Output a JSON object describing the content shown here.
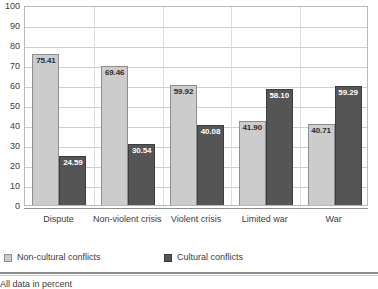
{
  "chart_data": {
    "type": "bar",
    "title": "",
    "subtitle": "",
    "xlabel": "",
    "ylabel": "",
    "ylim": [
      0,
      100
    ],
    "yticks": [
      0,
      10,
      20,
      30,
      40,
      50,
      60,
      70,
      80,
      90,
      100
    ],
    "grid": true,
    "legend_position": "bottom-left",
    "categories": [
      "Dispute",
      "Non-violent crisis",
      "Violent crisis",
      "Limited war",
      "War"
    ],
    "series": [
      {
        "name": "Non-cultural conflicts",
        "color": "#cccccc",
        "values": [
          75.41,
          69.46,
          59.92,
          41.9,
          40.71
        ],
        "labels": [
          "75.41",
          "69.46",
          "59.92",
          "41.90",
          "40.71"
        ]
      },
      {
        "name": "Cultural conflicts",
        "color": "#555555",
        "values": [
          24.59,
          30.54,
          40.08,
          58.1,
          59.29
        ],
        "labels": [
          "24.59",
          "30.54",
          "40.08",
          "58.10",
          "59.29"
        ]
      }
    ],
    "annotations": [
      "All data in percent"
    ]
  },
  "axis": {
    "y_tick_labels": [
      "100",
      "90",
      "80",
      "70",
      "60",
      "50",
      "40",
      "30",
      "20",
      "10",
      "0"
    ]
  },
  "legend": {
    "items": [
      {
        "label": "Non-cultural conflicts",
        "swatch": "light-gray-square"
      },
      {
        "label": "Cultural conflicts",
        "swatch": "dark-gray-square"
      }
    ]
  },
  "footer": {
    "note": "All data in percent"
  }
}
